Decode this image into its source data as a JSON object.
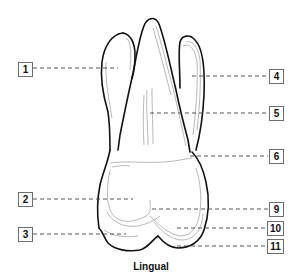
{
  "figure": {
    "caption": "Lingual",
    "labels": [
      {
        "id": "1",
        "side": "left"
      },
      {
        "id": "2",
        "side": "left"
      },
      {
        "id": "3",
        "side": "left"
      },
      {
        "id": "4",
        "side": "right"
      },
      {
        "id": "5",
        "side": "right"
      },
      {
        "id": "6",
        "side": "right"
      },
      {
        "id": "9",
        "side": "right"
      },
      {
        "id": "10",
        "side": "right"
      },
      {
        "id": "11",
        "side": "right"
      }
    ],
    "colors": {
      "outline": "#111111",
      "inner_lines": "#9a9a9a",
      "leader": "#444444",
      "box_border": "#6e6e6e"
    }
  }
}
